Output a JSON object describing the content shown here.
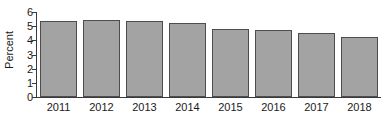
{
  "chart_data": {
    "type": "bar",
    "title": "",
    "xlabel": "",
    "ylabel": "Percent",
    "categories": [
      "2011",
      "2012",
      "2013",
      "2014",
      "2015",
      "2016",
      "2017",
      "2018"
    ],
    "values": [
      5.35,
      5.45,
      5.35,
      5.25,
      4.8,
      4.7,
      4.5,
      4.25
    ],
    "ylim": [
      0,
      6
    ],
    "ytick_labels": [
      "6",
      "5",
      "4",
      "3",
      "2",
      "1",
      "0"
    ],
    "ytick_values": [
      6,
      5,
      4,
      3,
      2,
      1,
      0
    ],
    "grid": false,
    "legend": "none",
    "bar_color": "#a3a3a3",
    "bar_border_color": "#4d4d4d",
    "axis_color": "#3a3a3a",
    "text_color": "#1a1a1a"
  }
}
